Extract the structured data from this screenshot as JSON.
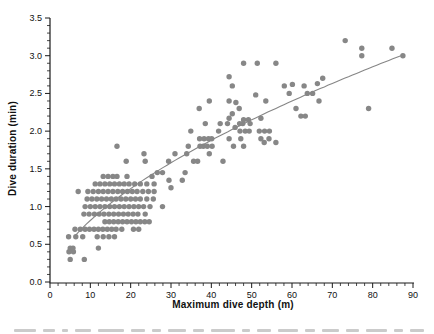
{
  "figure": {
    "x_axis_title": "Maximum dive depth (m)",
    "y_axis_title": "Dive duration (min)"
  },
  "colors": {
    "point_fill": "#878787",
    "trend_line": "#868686",
    "axis_line": "#1a1a1a",
    "tick_label": "#111111"
  },
  "chart_data": {
    "type": "scatter",
    "title": "",
    "xlabel": "Maximum dive depth (m)",
    "ylabel": "Dive duration (min)",
    "xlim": [
      0,
      90
    ],
    "ylim": [
      0,
      3.5
    ],
    "x_major_ticks": [
      0,
      10,
      20,
      30,
      40,
      50,
      60,
      70,
      80,
      90
    ],
    "x_tick_labels": [
      "0",
      "10",
      "20",
      "30",
      "40",
      "50",
      "60",
      "70",
      "80",
      "90"
    ],
    "x_minor_step": 2,
    "y_major_ticks": [
      0.0,
      0.5,
      1.0,
      1.5,
      2.0,
      2.5,
      3.0,
      3.5
    ],
    "y_tick_labels": [
      "0.0",
      "0.5",
      "1.0",
      "1.5",
      "2.0",
      "2.5",
      "3.0",
      "3.5"
    ],
    "y_minor_step": 0.1,
    "grid": false,
    "legend": "none",
    "trend": {
      "fit": "power",
      "a": 0.204,
      "b": 0.602,
      "x_start": 6,
      "x_end": 87.5
    },
    "points": [
      [
        5,
        0.3
      ],
      [
        8.5,
        0.3
      ],
      [
        4.7,
        0.4
      ],
      [
        5.8,
        0.4
      ],
      [
        5,
        0.45
      ],
      [
        5.7,
        0.45
      ],
      [
        12,
        0.45
      ],
      [
        4.6,
        0.6
      ],
      [
        6.4,
        0.6
      ],
      [
        8.1,
        0.6
      ],
      [
        11.7,
        0.6
      ],
      [
        13.2,
        0.6
      ],
      [
        14.6,
        0.6
      ],
      [
        16,
        0.6
      ],
      [
        6.2,
        0.7
      ],
      [
        7.5,
        0.7
      ],
      [
        8.7,
        0.7
      ],
      [
        9.8,
        0.7
      ],
      [
        10.9,
        0.7
      ],
      [
        12,
        0.7
      ],
      [
        13.1,
        0.7
      ],
      [
        14.2,
        0.7
      ],
      [
        15.3,
        0.7
      ],
      [
        16.4,
        0.7
      ],
      [
        17.8,
        0.7
      ],
      [
        20.7,
        0.7
      ],
      [
        22,
        0.7
      ],
      [
        13.6,
        0.8
      ],
      [
        14.7,
        0.8
      ],
      [
        15.8,
        0.8
      ],
      [
        16.9,
        0.8
      ],
      [
        18,
        0.8
      ],
      [
        19.1,
        0.8
      ],
      [
        20.2,
        0.8
      ],
      [
        21.3,
        0.8
      ],
      [
        22.4,
        0.8
      ],
      [
        23.5,
        0.8
      ],
      [
        24.6,
        0.8
      ],
      [
        8.4,
        0.9
      ],
      [
        9.7,
        0.9
      ],
      [
        11,
        0.9
      ],
      [
        12.2,
        0.9
      ],
      [
        13.4,
        0.9
      ],
      [
        14.6,
        0.9
      ],
      [
        15.8,
        0.9
      ],
      [
        17,
        0.9
      ],
      [
        18.2,
        0.9
      ],
      [
        19.4,
        0.9
      ],
      [
        20.6,
        0.9
      ],
      [
        21.8,
        0.9
      ],
      [
        23.6,
        0.9
      ],
      [
        8.7,
        1.0
      ],
      [
        10,
        1.0
      ],
      [
        11.2,
        1.0
      ],
      [
        12.4,
        1.0
      ],
      [
        13.6,
        1.0
      ],
      [
        14.8,
        1.0
      ],
      [
        16,
        1.0
      ],
      [
        17.2,
        1.0
      ],
      [
        18.4,
        1.0
      ],
      [
        19.6,
        1.0
      ],
      [
        20.8,
        1.0
      ],
      [
        22,
        1.0
      ],
      [
        23.2,
        1.0
      ],
      [
        24.8,
        1.0
      ],
      [
        27.9,
        1.0
      ],
      [
        9.2,
        1.1
      ],
      [
        10.4,
        1.1
      ],
      [
        11.6,
        1.1
      ],
      [
        12.8,
        1.1
      ],
      [
        14,
        1.1
      ],
      [
        15.2,
        1.1
      ],
      [
        16.4,
        1.1
      ],
      [
        17.6,
        1.1
      ],
      [
        18.8,
        1.1
      ],
      [
        20,
        1.1
      ],
      [
        21.2,
        1.1
      ],
      [
        22.4,
        1.1
      ],
      [
        24,
        1.1
      ],
      [
        25.6,
        1.1
      ],
      [
        7,
        1.2
      ],
      [
        9.4,
        1.2
      ],
      [
        10.7,
        1.2
      ],
      [
        12,
        1.2
      ],
      [
        13.2,
        1.2
      ],
      [
        14.4,
        1.2
      ],
      [
        15.6,
        1.2
      ],
      [
        16.8,
        1.2
      ],
      [
        18,
        1.2
      ],
      [
        19.2,
        1.2
      ],
      [
        20.4,
        1.2
      ],
      [
        21.6,
        1.2
      ],
      [
        23,
        1.2
      ],
      [
        24.4,
        1.2
      ],
      [
        25.8,
        1.2
      ],
      [
        30,
        1.25
      ],
      [
        11.2,
        1.3
      ],
      [
        12.4,
        1.3
      ],
      [
        13.6,
        1.3
      ],
      [
        14.8,
        1.3
      ],
      [
        16,
        1.3
      ],
      [
        17.2,
        1.3
      ],
      [
        18.4,
        1.3
      ],
      [
        19.6,
        1.3
      ],
      [
        21,
        1.3
      ],
      [
        22.4,
        1.3
      ],
      [
        24,
        1.3
      ],
      [
        25.8,
        1.3
      ],
      [
        29.5,
        1.35
      ],
      [
        32.8,
        1.35
      ],
      [
        13.2,
        1.4
      ],
      [
        14.4,
        1.4
      ],
      [
        15.6,
        1.4
      ],
      [
        16.6,
        1.4
      ],
      [
        19.1,
        1.4
      ],
      [
        25.3,
        1.4
      ],
      [
        26.6,
        1.45
      ],
      [
        27.9,
        1.45
      ],
      [
        33.5,
        1.45
      ],
      [
        18.9,
        1.6
      ],
      [
        23.6,
        1.6
      ],
      [
        29.4,
        1.6
      ],
      [
        35.6,
        1.6
      ],
      [
        36.6,
        1.6
      ],
      [
        42.9,
        1.6
      ],
      [
        23.3,
        1.7
      ],
      [
        31,
        1.7
      ],
      [
        33.9,
        1.7
      ],
      [
        39.5,
        1.7
      ],
      [
        16.6,
        1.8
      ],
      [
        34.3,
        1.8
      ],
      [
        37.2,
        1.8
      ],
      [
        38,
        1.8
      ],
      [
        39,
        1.8
      ],
      [
        40.2,
        1.8
      ],
      [
        45.5,
        1.8
      ],
      [
        48,
        1.8
      ],
      [
        53.1,
        1.85
      ],
      [
        56,
        1.85
      ],
      [
        37.1,
        1.9
      ],
      [
        38.2,
        1.9
      ],
      [
        39.3,
        1.9
      ],
      [
        40.1,
        1.9
      ],
      [
        44.4,
        1.9
      ],
      [
        47.3,
        1.9
      ],
      [
        52.3,
        1.9
      ],
      [
        54.3,
        1.9
      ],
      [
        34.9,
        2.0
      ],
      [
        41.8,
        2.0
      ],
      [
        47.1,
        2.0
      ],
      [
        48.4,
        2.0
      ],
      [
        49.4,
        2.0
      ],
      [
        51.9,
        2.0
      ],
      [
        53.2,
        2.0
      ],
      [
        54.4,
        2.0
      ],
      [
        45.9,
        2.05
      ],
      [
        38.5,
        2.1
      ],
      [
        42.2,
        2.1
      ],
      [
        44,
        2.1
      ],
      [
        47,
        2.1
      ],
      [
        47.8,
        2.1
      ],
      [
        49.6,
        2.1
      ],
      [
        48,
        2.15
      ],
      [
        49.2,
        2.15
      ],
      [
        44.4,
        2.17
      ],
      [
        52.3,
        2.17
      ],
      [
        45.2,
        2.23
      ],
      [
        62.2,
        2.2
      ],
      [
        63.3,
        2.2
      ],
      [
        37,
        2.3
      ],
      [
        46.9,
        2.3
      ],
      [
        61,
        2.3
      ],
      [
        79,
        2.3
      ],
      [
        39.5,
        2.4
      ],
      [
        44.4,
        2.4
      ],
      [
        46.1,
        2.38
      ],
      [
        53.5,
        2.4
      ],
      [
        66.7,
        2.4
      ],
      [
        51,
        2.48
      ],
      [
        59.3,
        2.5
      ],
      [
        63.8,
        2.5
      ],
      [
        65.1,
        2.5
      ],
      [
        45.2,
        2.6
      ],
      [
        58.1,
        2.6
      ],
      [
        60.1,
        2.62
      ],
      [
        63,
        2.6
      ],
      [
        66.3,
        2.63
      ],
      [
        44.4,
        2.72
      ],
      [
        67.6,
        2.7
      ],
      [
        48,
        2.9
      ],
      [
        51.4,
        2.9
      ],
      [
        56,
        2.9
      ],
      [
        77.3,
        3.0
      ],
      [
        87.5,
        3.0
      ],
      [
        77.3,
        3.1
      ],
      [
        84.8,
        3.1
      ],
      [
        73.2,
        3.2
      ]
    ]
  }
}
